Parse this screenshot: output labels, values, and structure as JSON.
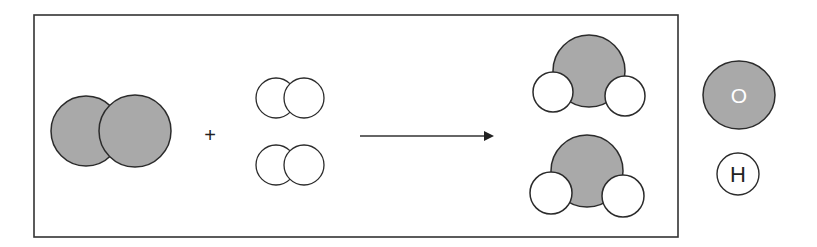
{
  "diagram": {
    "type": "chemical-reaction",
    "colors": {
      "oxygen_fill": "#a9a9a9",
      "hydrogen_fill": "#ffffff",
      "stroke": "#2b2b2b",
      "box": "#333333"
    },
    "reactants": [
      {
        "name": "O2",
        "count": 1
      },
      {
        "name": "H2",
        "count": 2
      }
    ],
    "plus_sign": "+",
    "products": [
      {
        "name": "H2O",
        "count": 2
      }
    ],
    "legend": [
      {
        "symbol": "O",
        "element": "oxygen"
      },
      {
        "symbol": "H",
        "element": "hydrogen"
      }
    ]
  }
}
